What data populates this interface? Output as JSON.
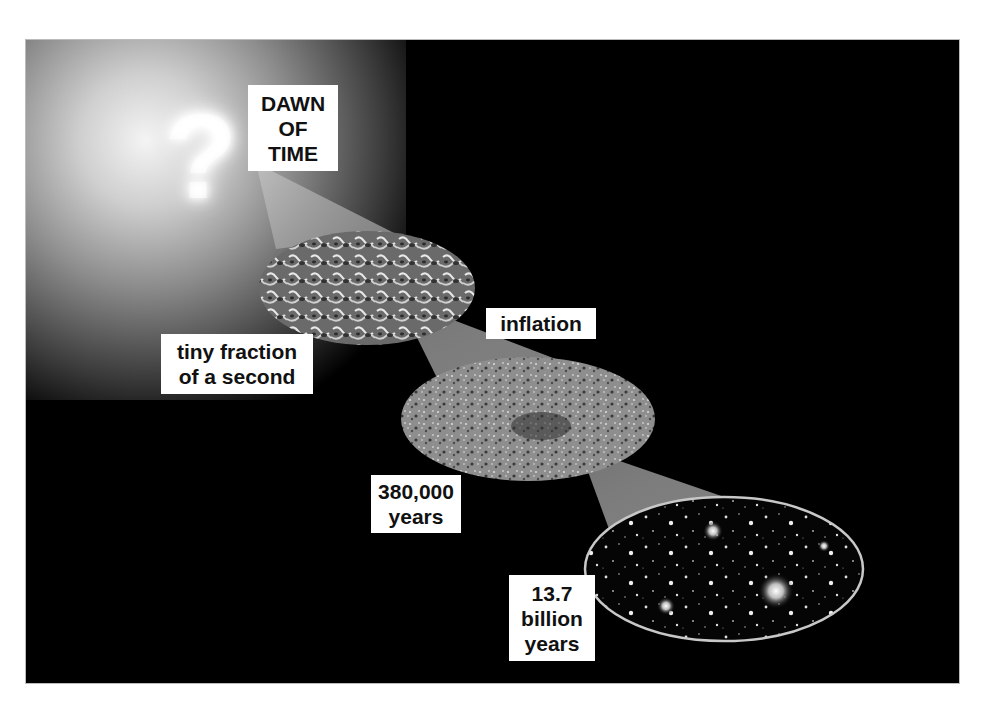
{
  "diagram": {
    "colors": {
      "background": "#000000",
      "page": "#ffffff",
      "label_bg": "#ffffff",
      "label_text": "#111111",
      "cone": "#9a9a9a",
      "ellipse_border": "#c8c8c8"
    },
    "icon": "question-mark-glow-icon",
    "question_glyph": "?",
    "stages": [
      {
        "id": "dawn",
        "lines": [
          "DAWN",
          "OF",
          "TIME"
        ]
      },
      {
        "id": "tiny",
        "lines": [
          "tiny fraction",
          "of a second"
        ],
        "image": "quantum-foam"
      },
      {
        "id": "inflation",
        "lines": [
          "inflation"
        ]
      },
      {
        "id": "cmb",
        "lines": [
          "380,000",
          "years"
        ],
        "image": "cosmic-microwave-background"
      },
      {
        "id": "today",
        "lines": [
          "13.7",
          "billion",
          "years"
        ],
        "image": "deep-field-galaxies"
      }
    ]
  }
}
